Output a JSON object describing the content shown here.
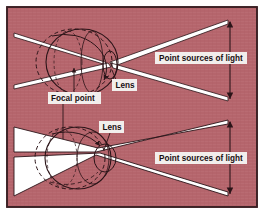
{
  "figure": {
    "name": "eye-accommodation-diagram",
    "background_color": "#b5656c",
    "border_color": "#3a2024",
    "ray_fill_color": "#ffffff",
    "line_color": "#2b1418",
    "label_background_color": "#f2eeec",
    "label_text_color": "#1a1012"
  },
  "panels": [
    {
      "id": "top-panel",
      "description": "Relaxed eye: elongated eyeball, thin crossing light rays",
      "labels": {
        "point_sources": "Point sources of light",
        "lens": "Lens",
        "focal_point": "Focal point"
      }
    },
    {
      "id": "bottom-panel",
      "description": "Accommodated eye: rounded eyeball, broad white light cones",
      "labels": {
        "point_sources": "Point sources of light",
        "lens": "Lens"
      }
    }
  ],
  "labels": {
    "point_sources_top": "Point sources of light",
    "point_sources_bottom": "Point sources of light",
    "lens_top": "Lens",
    "lens_bottom": "Lens",
    "focal_point": "Focal point"
  }
}
